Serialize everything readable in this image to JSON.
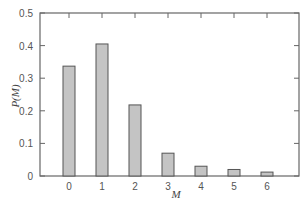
{
  "chart_data": {
    "type": "bar",
    "title": "",
    "xlabel": "M",
    "ylabel": "P(M)",
    "categories": [
      "0",
      "1",
      "2",
      "3",
      "4",
      "5",
      "6"
    ],
    "values": [
      0.337,
      0.405,
      0.218,
      0.07,
      0.03,
      0.02,
      0.012
    ],
    "ylim": [
      0,
      0.5
    ],
    "yticks": [
      "0",
      "0.1",
      "0.2",
      "0.3",
      "0.4",
      "0.5"
    ],
    "grid": false,
    "legend": null,
    "colors": {
      "bar_fill": "#c4c4c4",
      "bar_stroke": "#555555",
      "axis": "#666666"
    }
  }
}
